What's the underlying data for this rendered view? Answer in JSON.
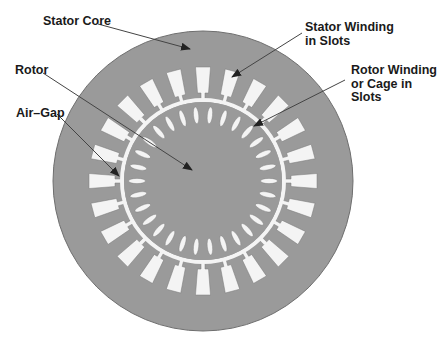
{
  "diagram": {
    "colors": {
      "background": "#ffffff",
      "core": "#9a9a9a",
      "core_edge": "#6e6e6e",
      "slot": "#f4f4f4",
      "leader": "#444444",
      "text": "#1a1a1a"
    },
    "geometry": {
      "center": [
        203,
        181
      ],
      "outer_radius": 150,
      "airgap_inner_radius": 79,
      "airgap_outer_radius": 83,
      "stator_slot_count": 24,
      "rotor_slot_count": 30
    },
    "labels": [
      {
        "id": "stator-core",
        "lines": [
          "Stator Core"
        ],
        "x": 43,
        "y": 15,
        "arrow_from": [
          98,
          24
        ],
        "arrow_to": [
          190,
          49
        ]
      },
      {
        "id": "stator-winding",
        "lines": [
          "Stator Winding",
          "in Slots"
        ],
        "x": 305,
        "y": 21,
        "arrow_from": [
          302,
          33
        ],
        "arrow_to": [
          232,
          77
        ]
      },
      {
        "id": "rotor-winding",
        "lines": [
          "Rotor Winding",
          "or Cage in",
          "Slots"
        ],
        "x": 351,
        "y": 64,
        "arrow_from": [
          345,
          80
        ],
        "arrow_to": [
          254,
          126
        ]
      },
      {
        "id": "rotor",
        "lines": [
          "Rotor"
        ],
        "x": 15,
        "y": 64,
        "arrow_from": [
          43,
          73
        ],
        "arrow_to": [
          192,
          170
        ]
      },
      {
        "id": "air-gap",
        "lines": [
          "Air–Gap"
        ],
        "x": 16,
        "y": 107,
        "arrow_from": [
          57,
          114
        ],
        "arrow_to": [
          119,
          176
        ]
      }
    ]
  }
}
